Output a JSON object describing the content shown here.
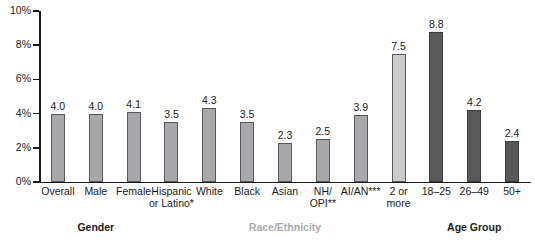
{
  "chart_data": {
    "type": "bar",
    "title": "",
    "subtitle": "",
    "xlabel": "",
    "ylabel": "",
    "ylim": [
      0,
      10
    ],
    "y_tick_labels": [
      "0%",
      "2%",
      "4%",
      "6%",
      "8%",
      "10%"
    ],
    "y_tick_values": [
      0,
      2,
      4,
      6,
      8,
      10
    ],
    "y_unit": "%",
    "grid": false,
    "legend": null,
    "categories": [
      "Overall",
      "Male",
      "Female",
      "Hispanic\nor Latino*",
      "White",
      "Black",
      "Asian",
      "NH/\nOPI**",
      "AI/AN***",
      "2 or\nmore",
      "18–25",
      "26–49",
      "50+"
    ],
    "values": [
      4.0,
      4.0,
      4.1,
      3.5,
      4.3,
      3.5,
      2.3,
      2.5,
      3.9,
      7.5,
      8.8,
      4.2,
      2.4
    ],
    "value_labels": [
      "4.0",
      "4.0",
      "4.1",
      "3.5",
      "4.3",
      "3.5",
      "2.3",
      "2.5",
      "3.9",
      "7.5",
      "8.8",
      "4.2",
      "2.4"
    ],
    "bar_styles": [
      "light",
      "light",
      "light",
      "light",
      "light",
      "light",
      "light",
      "light",
      "light",
      "lighter",
      "dark",
      "dark",
      "dark"
    ],
    "groups": [
      {
        "label": "Gender",
        "style": "strong",
        "start_index": 0,
        "end_index": 2
      },
      {
        "label": "Race/Ethnicity",
        "style": "muted",
        "start_index": 3,
        "end_index": 9
      },
      {
        "label": "Age Group",
        "style": "strong",
        "start_index": 10,
        "end_index": 12
      }
    ],
    "colors": {
      "bar_light": "#a6a8ab",
      "bar_lighter": "#c9cbcd",
      "bar_dark": "#58595b",
      "axis": "#1a1a1a",
      "text": "#1a1a1a",
      "muted_text": "#a8aaac",
      "background": "#ffffff"
    },
    "footnotes": [
      "*",
      "**",
      "***"
    ]
  }
}
